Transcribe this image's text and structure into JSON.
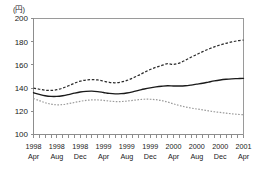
{
  "chart_data": {
    "type": "line",
    "title": "",
    "subtitle": "",
    "unit_label": "(円)",
    "xlabel": "",
    "ylabel": "",
    "ylim": [
      100,
      200
    ],
    "yticks": [
      100,
      120,
      140,
      160,
      180,
      200
    ],
    "ytick_labels": [
      "100",
      "120",
      "140",
      "160",
      "180",
      "200"
    ],
    "grid": false,
    "legend_position": "none",
    "x_tick_interval_months": 1,
    "x_label_interval_months": 4,
    "categories": [
      "1998 Apr",
      "1998 May",
      "1998 Jun",
      "1998 Jul",
      "1998 Aug",
      "1998 Sep",
      "1998 Oct",
      "1998 Nov",
      "1998 Dec",
      "1999 Jan",
      "1999 Feb",
      "1999 Mar",
      "1999 Apr",
      "1999 May",
      "1999 Jun",
      "1999 Jul",
      "1999 Aug",
      "1999 Sep",
      "1999 Oct",
      "1999 Nov",
      "1999 Dec",
      "2000 Jan",
      "2000 Feb",
      "2000 Mar",
      "2000 Apr",
      "2000 May",
      "2000 Jun",
      "2000 Jul",
      "2000 Aug",
      "2000 Sep",
      "2000 Oct",
      "2000 Nov",
      "2000 Dec",
      "2001 Jan",
      "2001 Feb",
      "2001 Mar",
      "2001 Apr"
    ],
    "xtick_labels": [
      {
        "year": "1998",
        "month": "Apr",
        "index": 0
      },
      {
        "year": "1998",
        "month": "Aug",
        "index": 4
      },
      {
        "year": "1998",
        "month": "Dec",
        "index": 8
      },
      {
        "year": "1999",
        "month": "Apr",
        "index": 12
      },
      {
        "year": "1999",
        "month": "Aug",
        "index": 16
      },
      {
        "year": "1999",
        "month": "Dec",
        "index": 20
      },
      {
        "year": "2000",
        "month": "Apr",
        "index": 24
      },
      {
        "year": "2000",
        "month": "Aug",
        "index": 28
      },
      {
        "year": "2000",
        "month": "Dec",
        "index": 32
      },
      {
        "year": "2001",
        "month": "Apr",
        "index": 36
      }
    ],
    "series": [
      {
        "name": "upper",
        "style": "dashed",
        "color": "#2b2b2b",
        "values": [
          140.0,
          139.0,
          138.2,
          138.0,
          138.6,
          140.0,
          142.0,
          144.2,
          146.0,
          147.0,
          147.4,
          147.0,
          146.0,
          145.0,
          144.6,
          145.2,
          146.6,
          148.6,
          151.0,
          153.6,
          156.0,
          158.0,
          159.6,
          161.0,
          160.4,
          161.6,
          164.0,
          166.6,
          169.0,
          171.4,
          173.6,
          175.6,
          177.2,
          178.6,
          179.8,
          180.8,
          181.4
        ]
      },
      {
        "name": "middle",
        "style": "solid",
        "color": "#1a1a1a",
        "values": [
          136.0,
          134.6,
          133.4,
          132.8,
          132.8,
          133.4,
          134.4,
          135.6,
          136.6,
          137.2,
          137.4,
          137.0,
          136.2,
          135.4,
          135.0,
          135.2,
          135.8,
          136.8,
          138.0,
          139.2,
          140.2,
          141.0,
          141.6,
          142.0,
          141.8,
          141.8,
          142.0,
          142.6,
          143.4,
          144.2,
          145.2,
          146.2,
          147.0,
          147.6,
          148.0,
          148.2,
          148.4
        ]
      },
      {
        "name": "lower",
        "style": "dotted",
        "color": "#9b9b9b",
        "values": [
          131.0,
          129.2,
          127.4,
          126.2,
          125.6,
          125.8,
          126.6,
          127.6,
          128.6,
          129.4,
          129.8,
          129.8,
          129.4,
          128.8,
          128.4,
          128.4,
          128.8,
          129.4,
          130.0,
          130.4,
          130.4,
          130.0,
          129.2,
          128.0,
          126.4,
          125.0,
          123.8,
          122.8,
          122.0,
          121.2,
          120.4,
          119.6,
          119.0,
          118.4,
          117.8,
          117.4,
          117.0
        ]
      }
    ]
  }
}
